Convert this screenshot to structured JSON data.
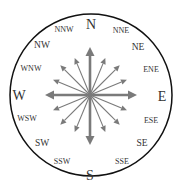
{
  "diagram": {
    "type": "compass-rose",
    "center": [
      90,
      95
    ],
    "ring": {
      "radius": 81,
      "stroke": "#111111",
      "stroke_width": 1.5
    },
    "arrow_color": "#7a7a7a",
    "labels": [
      {
        "text": "N",
        "x": 91,
        "y": 24,
        "size": "major"
      },
      {
        "text": "NNE",
        "x": 121,
        "y": 30,
        "size": "minor"
      },
      {
        "text": "NE",
        "x": 138,
        "y": 47,
        "size": "inter"
      },
      {
        "text": "ENE",
        "x": 151,
        "y": 69,
        "size": "minor"
      },
      {
        "text": "E",
        "x": 162,
        "y": 96,
        "size": "major"
      },
      {
        "text": "ESE",
        "x": 151,
        "y": 120,
        "size": "minor"
      },
      {
        "text": "SE",
        "x": 142,
        "y": 143,
        "size": "inter"
      },
      {
        "text": "SSE",
        "x": 122,
        "y": 161,
        "size": "minor"
      },
      {
        "text": "S",
        "x": 90,
        "y": 175,
        "size": "major"
      },
      {
        "text": "SSW",
        "x": 62,
        "y": 161,
        "size": "minor"
      },
      {
        "text": "SW",
        "x": 42,
        "y": 143,
        "size": "inter"
      },
      {
        "text": "WSW",
        "x": 27,
        "y": 118,
        "size": "minor"
      },
      {
        "text": "W",
        "x": 19,
        "y": 95,
        "size": "major"
      },
      {
        "text": "WNW",
        "x": 31,
        "y": 68,
        "size": "minor"
      },
      {
        "text": "NW",
        "x": 42,
        "y": 45,
        "size": "inter"
      },
      {
        "text": "NNW",
        "x": 64,
        "y": 29,
        "size": "minor"
      }
    ],
    "arrows": [
      {
        "direction": "N",
        "angle_deg": 0,
        "length": 48,
        "weight": "major"
      },
      {
        "direction": "NNE",
        "angle_deg": 22.5,
        "length": 40,
        "weight": "minor"
      },
      {
        "direction": "NE",
        "angle_deg": 45,
        "length": 42,
        "weight": "minor"
      },
      {
        "direction": "ENE",
        "angle_deg": 67.5,
        "length": 40,
        "weight": "minor"
      },
      {
        "direction": "E",
        "angle_deg": 90,
        "length": 47,
        "weight": "major"
      },
      {
        "direction": "ESE",
        "angle_deg": 112.5,
        "length": 40,
        "weight": "minor"
      },
      {
        "direction": "SE",
        "angle_deg": 135,
        "length": 42,
        "weight": "minor"
      },
      {
        "direction": "SSE",
        "angle_deg": 157.5,
        "length": 40,
        "weight": "minor"
      },
      {
        "direction": "S",
        "angle_deg": 180,
        "length": 50,
        "weight": "major"
      },
      {
        "direction": "SSW",
        "angle_deg": 202.5,
        "length": 40,
        "weight": "minor"
      },
      {
        "direction": "SW",
        "angle_deg": 225,
        "length": 42,
        "weight": "minor"
      },
      {
        "direction": "WSW",
        "angle_deg": 247.5,
        "length": 40,
        "weight": "minor"
      },
      {
        "direction": "W",
        "angle_deg": 270,
        "length": 45,
        "weight": "major"
      },
      {
        "direction": "WNW",
        "angle_deg": 292.5,
        "length": 40,
        "weight": "minor"
      },
      {
        "direction": "NW",
        "angle_deg": 315,
        "length": 42,
        "weight": "minor"
      },
      {
        "direction": "NNW",
        "angle_deg": 337.5,
        "length": 40,
        "weight": "minor"
      }
    ]
  }
}
